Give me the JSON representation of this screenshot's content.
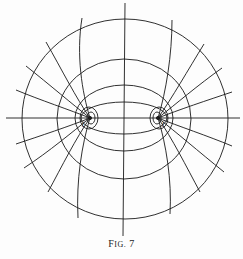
{
  "figure": {
    "caption_prefix": "F",
    "caption_smallcaps": "IG.",
    "caption_number": "7",
    "line_color": "#1a1a1a",
    "background": "#fdfdfd"
  },
  "diagram": {
    "type": "confocal ellipses and hyperbolas (elliptic coordinate grid)",
    "foci_labels": [
      "f",
      "f"
    ],
    "center": [
      123,
      118
    ],
    "foci": [
      [
        90,
        118
      ],
      [
        158,
        118
      ]
    ],
    "ellipse_count": 4,
    "hyperbola_branch_count_per_side": 9
  }
}
